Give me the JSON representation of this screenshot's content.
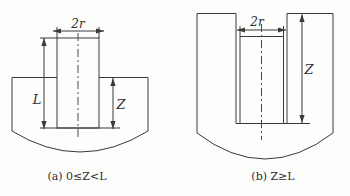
{
  "colors": {
    "line": "#3a3a3a",
    "background": "#fdfdfc",
    "text": "#2e2e2e"
  },
  "figure_a": {
    "dim_width_label": "2r",
    "dim_length_label": "L",
    "dim_depth_label": "Z",
    "caption": "(a) 0≤Z<L"
  },
  "figure_b": {
    "dim_width_label": "2r",
    "dim_depth_label": "Z",
    "caption": "(b) Z≥L"
  }
}
